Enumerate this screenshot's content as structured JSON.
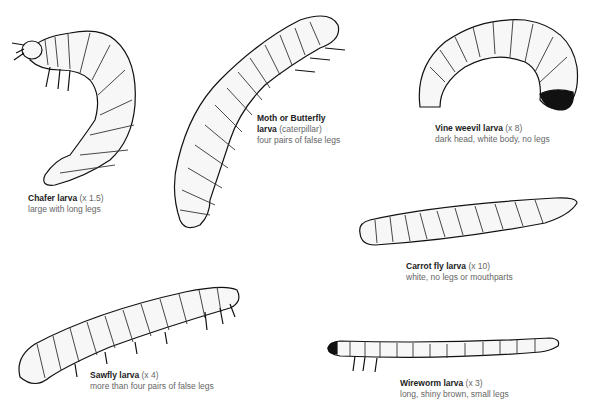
{
  "larvae": [
    {
      "name": "Chafer larva",
      "scale": "(x 1.5)",
      "desc": "large with long legs"
    },
    {
      "name": "Moth or Butterfly",
      "name2": "larva",
      "note": "(caterpillar)",
      "desc": "four pairs of false legs"
    },
    {
      "name": "Vine weevil larva",
      "scale": "(x 8)",
      "desc": "dark head, white body, no legs"
    },
    {
      "name": "Carrot fly larva",
      "scale": "(x 10)",
      "desc": "white, no legs or mouthparts"
    },
    {
      "name": "Sawfly larva",
      "scale": "(x 4)",
      "desc": "more than four pairs of false legs"
    },
    {
      "name": "Wireworm larva",
      "scale": "(x 3)",
      "desc": "long, shiny brown, small legs"
    }
  ]
}
